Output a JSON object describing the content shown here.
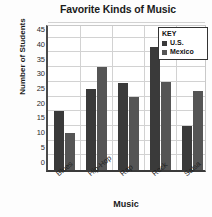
{
  "chart_data": {
    "type": "bar",
    "title": "Favorite Kinds of Music",
    "xlabel": "Music",
    "ylabel": "Number of Students",
    "categories": [
      "Blues",
      "Hip-Hop",
      "Rap",
      "Rock",
      "Salsa"
    ],
    "series": [
      {
        "name": "U.S.",
        "values": [
          20,
          27.5,
          29.5,
          42,
          15
        ],
        "color": "#3a3a3a"
      },
      {
        "name": "Mexico",
        "values": [
          12.5,
          35,
          25,
          30,
          27
        ],
        "color": "#555555"
      }
    ],
    "ylim": [
      0,
      50
    ],
    "yticks": [
      0,
      5,
      10,
      15,
      20,
      25,
      30,
      35,
      40,
      45
    ],
    "ytick_labels": [
      "0",
      "5",
      "10",
      "15",
      "20",
      "25",
      "30",
      "35",
      "40",
      "45"
    ],
    "grid": true,
    "legend_position": "top-right"
  },
  "legend": {
    "title": "KEY",
    "entries": [
      {
        "label": "U.S.",
        "color": "#3a3a3a"
      },
      {
        "label": "Mexico",
        "color": "#555555"
      }
    ]
  }
}
